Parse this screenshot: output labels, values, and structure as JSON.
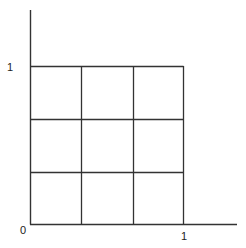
{
  "diagram": {
    "type": "unit-square-grid",
    "grid_divisions": 3,
    "labels": {
      "origin": "0",
      "x_tick": "1",
      "y_tick": "1"
    },
    "colors": {
      "line": "#333333",
      "background": "#ffffff"
    }
  }
}
